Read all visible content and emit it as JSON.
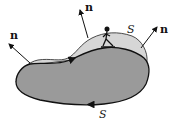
{
  "diagram": {
    "labels": {
      "normal_left": "n",
      "normal_top": "n",
      "normal_right": "n",
      "surface_label": "S",
      "boundary_label": "S"
    },
    "colors": {
      "surface_fill": "#d6d6d6",
      "base_fill": "#9a9a9a",
      "stroke": "#111111"
    }
  }
}
